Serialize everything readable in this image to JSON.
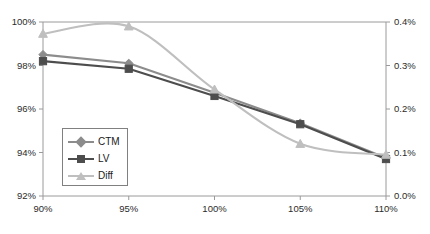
{
  "chart_data": {
    "type": "line",
    "title": "",
    "xlabel": "",
    "ylabel": "",
    "categories": [
      "90%",
      "95%",
      "100%",
      "105%",
      "110%"
    ],
    "x": [
      90,
      95,
      100,
      105,
      110
    ],
    "grid": false,
    "legend_position": "inside-lower-left",
    "axes": {
      "left": {
        "ylim": [
          92,
          100
        ],
        "ticks": [
          92,
          94,
          96,
          98,
          100
        ],
        "tick_labels": [
          "92%",
          "94%",
          "96%",
          "98%",
          "100%"
        ],
        "series": [
          "CTM",
          "LV"
        ]
      },
      "right": {
        "ylim": [
          0.0,
          0.4
        ],
        "ticks": [
          0.0,
          0.1,
          0.2,
          0.3,
          0.4
        ],
        "tick_labels": [
          "0.0%",
          "0.1%",
          "0.2%",
          "0.3%",
          "0.4%"
        ],
        "series": [
          "Diff"
        ]
      },
      "x": {
        "xlim": [
          90,
          110
        ],
        "ticks": [
          90,
          95,
          100,
          105,
          110
        ],
        "tick_labels": [
          "90%",
          "95%",
          "100%",
          "105%",
          "110%"
        ]
      }
    },
    "series": [
      {
        "name": "CTM",
        "axis": "left",
        "marker": "diamond",
        "color": "#8c8c8c",
        "values": [
          98.5,
          98.1,
          96.75,
          95.35,
          93.75
        ]
      },
      {
        "name": "LV",
        "axis": "left",
        "marker": "square",
        "color": "#4d4d4d",
        "values": [
          98.2,
          97.85,
          96.6,
          95.3,
          93.7
        ]
      },
      {
        "name": "Diff",
        "axis": "right",
        "marker": "triangle",
        "color": "#bfbfbf",
        "values": [
          0.373,
          0.39,
          0.245,
          0.12,
          0.095
        ]
      }
    ]
  },
  "legend": {
    "items": [
      {
        "label": "CTM"
      },
      {
        "label": "LV"
      },
      {
        "label": "Diff"
      }
    ]
  },
  "caption": {
    "text": ""
  },
  "colors": {
    "ctm": "#8c8c8c",
    "lv": "#4d4d4d",
    "diff": "#bfbfbf",
    "axis": "#9a9a9a",
    "text": "#2b2b2b",
    "background": "#ffffff"
  }
}
